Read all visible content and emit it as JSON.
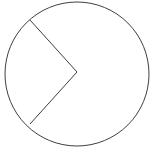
{
  "figure": {
    "kind": "geometry-diagram",
    "canvas": {
      "width": 159,
      "height": 157,
      "background_color": "#ffffff"
    },
    "style": {
      "stroke_color": "#3f3f3f",
      "stroke_width": 1,
      "fill": "none"
    },
    "shapes": [
      {
        "name": "circle-outline",
        "type": "circle",
        "cx": 77,
        "cy": 74,
        "r": 72
      },
      {
        "name": "wedge-chords",
        "type": "polyline",
        "points": "30,20 77,72 30,124",
        "vertices": [
          {
            "label": "upper-chord-endpoint",
            "x": 30,
            "y": 20
          },
          {
            "label": "apex",
            "x": 77,
            "y": 72
          },
          {
            "label": "lower-chord-endpoint",
            "x": 30,
            "y": 124
          }
        ]
      }
    ]
  }
}
